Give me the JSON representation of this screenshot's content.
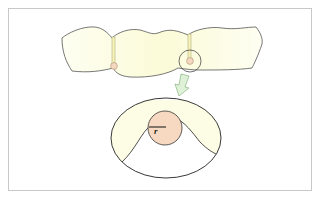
{
  "diagram": {
    "elements": {
      "bridge": {
        "units": 3,
        "connectors": 2,
        "fill": "#fdfde6",
        "stroke": "#555555"
      },
      "connector_dot_fill": "#f4d8c0",
      "connector_bar_color": "#c9c98a",
      "magnify_circle": {
        "stroke": "#333333"
      },
      "arrow": {
        "fill": "#dff2d8",
        "stroke": "#7aa870",
        "direction": "down-left"
      },
      "detail_ellipse": {
        "stroke": "#222222",
        "fill": "#ffffff",
        "side_fill": "#fdfde6"
      },
      "connector_cross_section": {
        "fill": "#f6d9c0",
        "stroke": "#333333"
      },
      "radius_label": "r"
    },
    "colors": {
      "frame_border": "#c8c8c8",
      "background": "#ffffff"
    }
  },
  "caption": {
    "text": ""
  }
}
